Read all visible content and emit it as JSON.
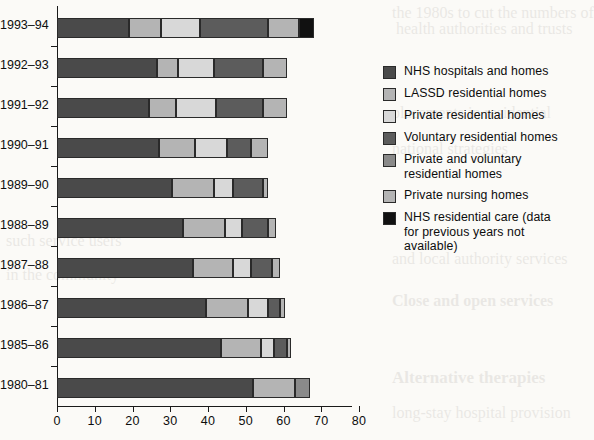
{
  "chart_data": {
    "type": "bar",
    "orientation": "horizontal",
    "stacked": true,
    "title": "",
    "xlabel": "",
    "ylabel": "",
    "xlim": [
      0,
      80
    ],
    "xticks": [
      0,
      10,
      20,
      30,
      40,
      50,
      60,
      70,
      80
    ],
    "grid": false,
    "legend_position": "right",
    "categories": [
      "1993–94",
      "1992–93",
      "1991–92",
      "1990–91",
      "1989–90",
      "1988–89",
      "1987–88",
      "1986–87",
      "1985–86",
      "1980–81"
    ],
    "series": [
      {
        "name": "NHS hospitals and homes",
        "color": "#4a4a4a",
        "values": [
          19.0,
          26.5,
          24.5,
          27.0,
          30.5,
          33.5,
          36.0,
          39.5,
          43.5,
          52.0
        ]
      },
      {
        "name": "LASSD residential homes",
        "color": "#b4b4b4",
        "values": [
          8.5,
          5.5,
          7.0,
          9.5,
          11.0,
          11.0,
          10.5,
          11.0,
          10.5,
          11.0
        ]
      },
      {
        "name": "Private residential homes",
        "color": "#d8d8d8",
        "values": [
          10.5,
          9.5,
          10.5,
          8.5,
          5.0,
          4.5,
          5.0,
          5.5,
          3.5,
          0.0
        ]
      },
      {
        "name": "Voluntary residential homes",
        "color": "#5c5c5c",
        "values": [
          18.0,
          13.0,
          12.5,
          6.5,
          8.0,
          7.0,
          5.5,
          3.0,
          3.5,
          0.0
        ]
      },
      {
        "name": "Private and voluntary residential homes",
        "color": "#8a8a8a",
        "values": [
          0.0,
          0.0,
          0.0,
          0.0,
          0.0,
          0.0,
          0.0,
          0.0,
          0.0,
          4.0
        ]
      },
      {
        "name": "Private nursing homes",
        "color": "#b4b4b4",
        "values": [
          8.0,
          6.5,
          6.5,
          4.5,
          1.5,
          2.0,
          2.0,
          1.5,
          1.0,
          0.0
        ]
      },
      {
        "name": "NHS residential care (data for previous years not available)",
        "color": "#111111",
        "values": [
          4.0,
          0.0,
          0.0,
          0.0,
          0.0,
          0.0,
          0.0,
          0.0,
          0.0,
          0.0
        ]
      }
    ],
    "totals": [
      68.0,
      61.0,
      61.0,
      56.0,
      56.0,
      58.0,
      59.0,
      60.5,
      62.0,
      67.0
    ]
  },
  "legend": {
    "items": [
      {
        "label": "NHS hospitals and homes",
        "color": "#4a4a4a"
      },
      {
        "label": "LASSD residential homes",
        "color": "#b4b4b4"
      },
      {
        "label": "Private residential homes",
        "color": "#d8d8d8"
      },
      {
        "label": "Voluntary residential homes",
        "color": "#5c5c5c"
      },
      {
        "label": "Private and voluntary residential homes",
        "color": "#8a8a8a"
      },
      {
        "label": "Private nursing homes",
        "color": "#b4b4b4"
      },
      {
        "label": "NHS residential care (data for previous years not available)",
        "color": "#111111"
      }
    ]
  },
  "page_bleed": {
    "lines": [
      "the 1980s to cut the numbers of",
      "health authorities and trusts",
      "placements in residential",
      "national strategies",
      "and local authority services",
      "Close and open services",
      "Alternative therapies",
      "long-stay hospital provision",
      "such service users",
      "in the community"
    ]
  }
}
